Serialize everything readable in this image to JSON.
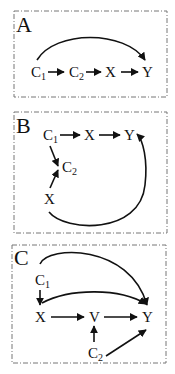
{
  "panels": [
    {
      "label": "A",
      "nodes": {
        "c1": "C",
        "c1_sub": "1",
        "c2": "C",
        "c2_sub": "2",
        "x": "X",
        "y": "Y"
      },
      "edges": [
        "C1->C2",
        "C2->X",
        "X->Y",
        "C1->Y (curved)"
      ]
    },
    {
      "label": "B",
      "nodes": {
        "c1": "C",
        "c1_sub": "1",
        "x_top": "X",
        "y": "Y",
        "c2": "C",
        "c2_sub": "2",
        "x_bottom": "X"
      },
      "edges": [
        "C1->X",
        "X->Y",
        "C1->C2",
        "X(bottom)->C2",
        "X(bottom)->Y (curved)"
      ]
    },
    {
      "label": "C",
      "nodes": {
        "c1": "C",
        "c1_sub": "1",
        "x": "X",
        "v": "V",
        "y": "Y",
        "c2": "C",
        "c2_sub": "2"
      },
      "edges": [
        "C1->X",
        "C1->Y (curved)",
        "X->Y (curved)",
        "X->V",
        "V->Y",
        "C2->V",
        "C2->Y"
      ]
    }
  ],
  "colors": {
    "stroke": "#111111",
    "border": "#777777"
  }
}
